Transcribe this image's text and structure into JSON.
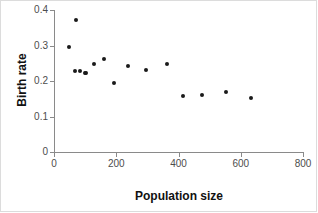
{
  "chart_data": {
    "type": "scatter",
    "title": "",
    "xlabel": "Population size",
    "ylabel": "Birth rate",
    "xlim": [
      0,
      800
    ],
    "ylim": [
      0,
      0.4
    ],
    "grid": false,
    "legend": null,
    "xticks": [
      "0",
      "200",
      "400",
      "600",
      "800"
    ],
    "xtick_values": [
      0,
      200,
      400,
      600,
      800
    ],
    "yticks": [
      "0",
      "0.1",
      "0.2",
      "0.3",
      "0.4"
    ],
    "ytick_values": [
      0,
      0.1,
      0.2,
      0.3,
      0.4
    ],
    "marker_color": "#1a1a1a",
    "axis_color": "#8a8a8a",
    "series": [
      {
        "name": "observations",
        "x": [
          48,
          67,
          82,
          100,
          104,
          127,
          162,
          192,
          239,
          294,
          363,
          416,
          477,
          553,
          633,
          72
        ],
        "y": [
          0.297,
          0.229,
          0.229,
          0.223,
          0.223,
          0.249,
          0.261,
          0.194,
          0.243,
          0.232,
          0.247,
          0.158,
          0.161,
          0.169,
          0.152,
          0.373
        ],
        "points": [
          {
            "x": 72,
            "y": 0.373
          },
          {
            "x": 48,
            "y": 0.297
          },
          {
            "x": 82,
            "y": 0.229
          },
          {
            "x": 100,
            "y": 0.223
          },
          {
            "x": 127,
            "y": 0.249
          },
          {
            "x": 162,
            "y": 0.261
          },
          {
            "x": 192,
            "y": 0.194
          },
          {
            "x": 239,
            "y": 0.243
          },
          {
            "x": 294,
            "y": 0.232
          },
          {
            "x": 363,
            "y": 0.247
          },
          {
            "x": 416,
            "y": 0.158
          },
          {
            "x": 477,
            "y": 0.161
          },
          {
            "x": 553,
            "y": 0.169
          },
          {
            "x": 633,
            "y": 0.152
          },
          {
            "x": 104,
            "y": 0.223
          },
          {
            "x": 67,
            "y": 0.229
          }
        ]
      }
    ]
  }
}
